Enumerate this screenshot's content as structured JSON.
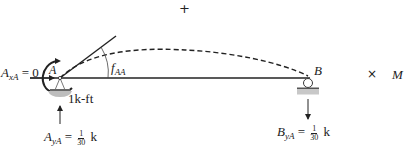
{
  "diagram": {
    "plus_marker": "+",
    "point_a_label": "A",
    "point_b_label": "B",
    "angle_label": {
      "main": "f",
      "sub": "AA"
    },
    "moment_label": "1k-ft",
    "reaction_ax": {
      "main": "A",
      "sub": "xA",
      "rhs": "= 0"
    },
    "reaction_ay": {
      "main": "A",
      "sub": "yA",
      "eq": "=",
      "num": "1",
      "den": "30",
      "unit": "k"
    },
    "reaction_by": {
      "main": "B",
      "sub": "yA",
      "eq": "=",
      "num": "1",
      "den": "30",
      "unit": "k"
    },
    "times_marker": "×",
    "m_label": "M",
    "colors": {
      "line": "#222222",
      "support_fill": "#bdbdbd",
      "background": "#ffffff"
    }
  }
}
